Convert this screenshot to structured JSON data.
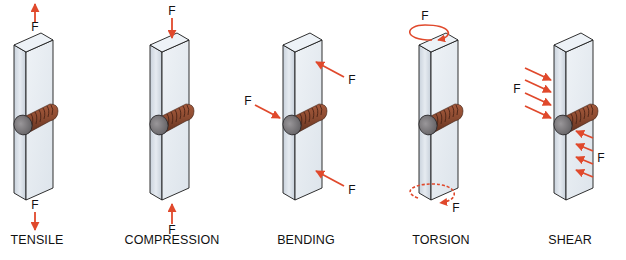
{
  "figure": {
    "force_symbol": "F",
    "colors": {
      "arrow": "#e0492c",
      "bar_front": "#d6dde6",
      "bar_side": "#e8eef4",
      "bar_top": "#edf2f7",
      "bar_outline": "#1a1a1a",
      "bolt_head": "#7c7a7c",
      "bolt_shank": "#8a4a30",
      "bolt_thread": "#5a2c1c",
      "text": "#111111"
    },
    "panels": [
      {
        "id": "tensile",
        "label": "TENSILE",
        "x": 0,
        "label_x": 37,
        "forces": [
          {
            "text": "F",
            "x": 35,
            "y": 27
          },
          {
            "text": "F",
            "x": 35,
            "y": 205
          }
        ]
      },
      {
        "id": "compression",
        "label": "COMPRESSION",
        "x": 136,
        "label_x": 172,
        "forces": [
          {
            "text": "F",
            "x": 172,
            "y": 11
          },
          {
            "text": "F",
            "x": 172,
            "y": 230
          }
        ]
      },
      {
        "id": "bending",
        "label": "BENDING",
        "x": 269,
        "label_x": 306,
        "forces": [
          {
            "text": "F",
            "x": 248,
            "y": 101
          },
          {
            "text": "F",
            "x": 352,
            "y": 80
          },
          {
            "text": "F",
            "x": 352,
            "y": 190
          }
        ]
      },
      {
        "id": "torsion",
        "label": "TORSION",
        "x": 405,
        "label_x": 441,
        "forces": [
          {
            "text": "F",
            "x": 425,
            "y": 16
          },
          {
            "text": "F",
            "x": 456,
            "y": 208
          }
        ]
      },
      {
        "id": "shear",
        "label": "SHEAR",
        "x": 540,
        "label_x": 570,
        "forces": [
          {
            "text": "F",
            "x": 517,
            "y": 89
          },
          {
            "text": "F",
            "x": 601,
            "y": 158
          }
        ]
      }
    ]
  }
}
